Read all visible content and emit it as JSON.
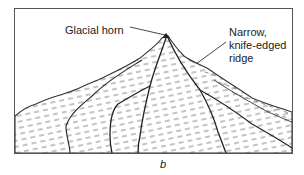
{
  "figure": {
    "panel_letter": "b",
    "labels": {
      "horn": "Glacial horn",
      "ridge_line1": "Narrow,",
      "ridge_line2": "knife-edged",
      "ridge_line3": "ridge"
    }
  },
  "colors": {
    "ink": "#222222",
    "frame": "#555555",
    "background": "#ffffff"
  }
}
